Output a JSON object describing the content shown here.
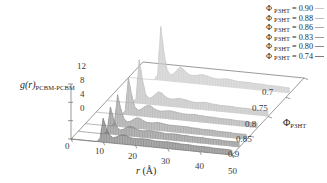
{
  "chart_data": {
    "type": "line",
    "title": "",
    "projection": "3d-waterfall",
    "xlabel": "r (Å)",
    "ylabel": "g(r)PCBM-PCBM",
    "zlabel": "ΦP3HT",
    "xlim": [
      0,
      50
    ],
    "ylim": [
      0,
      12
    ],
    "zlim": [
      0.7,
      0.9
    ],
    "grid": false,
    "legend_position": "top-right",
    "x_ticks": [
      "0",
      "10",
      "20",
      "30",
      "40",
      "50"
    ],
    "y_ticks": [
      "0",
      "4",
      "8",
      "12"
    ],
    "z_ticks": [
      "0.7",
      "0.75",
      "0.8",
      "0.85",
      "0.9"
    ],
    "x_tick_values": [
      0,
      10,
      20,
      30,
      40,
      50
    ],
    "y_tick_values": [
      0,
      4,
      8,
      12
    ],
    "z_tick_values": [
      0.7,
      0.75,
      0.8,
      0.85,
      0.9
    ],
    "x": [
      0,
      1,
      2,
      3,
      4,
      5,
      6,
      7,
      8,
      9,
      10,
      11,
      12,
      13,
      14,
      15,
      16,
      17,
      18,
      19,
      20,
      21,
      22,
      23,
      24,
      25,
      26,
      27,
      28,
      29,
      30,
      31,
      32,
      33,
      34,
      35,
      36,
      37,
      38,
      39,
      40,
      41,
      42,
      43,
      44,
      45,
      46,
      47,
      48,
      49,
      50
    ],
    "series": [
      {
        "name": "ΦP3HT = 0.74",
        "z": 0.74,
        "color": "#c9c9c9",
        "values": [
          0,
          0,
          0,
          0,
          0,
          0,
          0,
          0,
          0.05,
          1.2,
          11.8,
          6.2,
          2.4,
          1.5,
          1.8,
          2.6,
          3.4,
          3.0,
          2.3,
          1.9,
          1.8,
          1.9,
          2.1,
          2.2,
          2.1,
          1.9,
          1.7,
          1.6,
          1.6,
          1.7,
          1.8,
          1.8,
          1.7,
          1.6,
          1.5,
          1.5,
          1.5,
          1.5,
          1.5,
          1.4,
          1.4,
          1.4,
          1.4,
          1.3,
          1.3,
          1.3,
          1.3,
          1.3,
          1.2,
          1.2,
          1.2
        ]
      },
      {
        "name": "ΦP3HT = 0.80",
        "z": 0.8,
        "color": "#bdbdbd",
        "values": [
          0,
          0,
          0,
          0,
          0,
          0,
          0,
          0,
          0.05,
          1.0,
          9.6,
          5.4,
          2.2,
          1.4,
          1.7,
          2.4,
          3.0,
          2.8,
          2.2,
          1.8,
          1.7,
          1.8,
          2.0,
          2.0,
          1.9,
          1.8,
          1.6,
          1.5,
          1.5,
          1.6,
          1.7,
          1.7,
          1.6,
          1.5,
          1.5,
          1.4,
          1.4,
          1.4,
          1.4,
          1.4,
          1.3,
          1.3,
          1.3,
          1.3,
          1.3,
          1.2,
          1.2,
          1.2,
          1.2,
          1.2,
          1.1
        ]
      },
      {
        "name": "ΦP3HT = 0.83",
        "z": 0.83,
        "color": "#ababab",
        "values": [
          0,
          0,
          0,
          0,
          0,
          0,
          0,
          0,
          0.05,
          0.9,
          8.2,
          4.6,
          2.0,
          1.3,
          1.6,
          2.2,
          2.6,
          2.5,
          2.0,
          1.7,
          1.6,
          1.7,
          1.8,
          1.9,
          1.8,
          1.7,
          1.6,
          1.5,
          1.5,
          1.5,
          1.6,
          1.6,
          1.5,
          1.5,
          1.4,
          1.4,
          1.4,
          1.4,
          1.3,
          1.3,
          1.3,
          1.3,
          1.3,
          1.2,
          1.2,
          1.2,
          1.2,
          1.2,
          1.1,
          1.1,
          1.1
        ]
      },
      {
        "name": "ΦP3HT = 0.86",
        "z": 0.86,
        "color": "#9a9a9a",
        "values": [
          0,
          0,
          0,
          0,
          0,
          0,
          0,
          0,
          0.05,
          0.8,
          7.0,
          4.0,
          1.9,
          1.3,
          1.5,
          2.0,
          2.4,
          2.3,
          1.9,
          1.6,
          1.6,
          1.6,
          1.8,
          1.8,
          1.7,
          1.6,
          1.5,
          1.5,
          1.5,
          1.5,
          1.5,
          1.5,
          1.5,
          1.4,
          1.4,
          1.4,
          1.3,
          1.3,
          1.3,
          1.3,
          1.3,
          1.2,
          1.2,
          1.2,
          1.2,
          1.2,
          1.1,
          1.1,
          1.1,
          1.1,
          1.1
        ]
      },
      {
        "name": "ΦP3HT = 0.88",
        "z": 0.88,
        "color": "#8a8a8a",
        "values": [
          0,
          0,
          0,
          0,
          0,
          0,
          0,
          0,
          0.05,
          0.7,
          6.0,
          3.5,
          1.8,
          1.2,
          1.4,
          1.9,
          2.2,
          2.1,
          1.8,
          1.6,
          1.5,
          1.6,
          1.7,
          1.7,
          1.6,
          1.6,
          1.5,
          1.4,
          1.4,
          1.5,
          1.5,
          1.5,
          1.4,
          1.4,
          1.4,
          1.3,
          1.3,
          1.3,
          1.3,
          1.3,
          1.2,
          1.2,
          1.2,
          1.2,
          1.2,
          1.1,
          1.1,
          1.1,
          1.1,
          1.1,
          1.1
        ]
      },
      {
        "name": "ΦP3HT = 0.90",
        "z": 0.9,
        "color": "#7a7a7a",
        "values": [
          0,
          0,
          0,
          0,
          0,
          0,
          0,
          0,
          0.05,
          0.7,
          5.2,
          3.1,
          1.7,
          1.2,
          1.4,
          1.8,
          2.0,
          2.0,
          1.7,
          1.5,
          1.5,
          1.5,
          1.6,
          1.6,
          1.6,
          1.5,
          1.4,
          1.4,
          1.4,
          1.4,
          1.5,
          1.4,
          1.4,
          1.4,
          1.3,
          1.3,
          1.3,
          1.3,
          1.2,
          1.2,
          1.2,
          1.2,
          1.2,
          1.2,
          1.1,
          1.1,
          1.1,
          1.1,
          1.1,
          1.1,
          1.0
        ]
      }
    ],
    "legend_entries": [
      {
        "label": "ΦP3HT = 0.90"
      },
      {
        "label": "ΦP3HT = 0.88"
      },
      {
        "label": "ΦP3HT = 0.86"
      },
      {
        "label": "ΦP3HT = 0.83"
      },
      {
        "label": "ΦP3HT = 0.80"
      },
      {
        "label": "ΦP3HT = 0.74"
      }
    ]
  },
  "legend": {
    "rows": [
      {
        "phi": "Φ",
        "sub": "P3HT",
        "eq": " = ",
        "value": "0.90"
      },
      {
        "phi": "Φ",
        "sub": "P3HT",
        "eq": " = ",
        "value": "0.88"
      },
      {
        "phi": "Φ",
        "sub": "P3HT",
        "eq": " = ",
        "value": "0.86"
      },
      {
        "phi": "Φ",
        "sub": "P3HT",
        "eq": " = ",
        "value": "0.83"
      },
      {
        "phi": "Φ",
        "sub": "P3HT",
        "eq": " = ",
        "value": "0.80"
      },
      {
        "phi": "Φ",
        "sub": "P3HT",
        "eq": " = ",
        "value": "0.74"
      }
    ]
  },
  "axes": {
    "y_label_main": "g(r)",
    "y_label_sub": "PCBM-PCBM",
    "y_label_g": "g",
    "y_label_r": "(r)",
    "x_label": "r (Å)",
    "x_label_italic": "r",
    "x_label_unit": " (Å)",
    "z_label_phi": "Φ",
    "z_label_sub": "P3HT",
    "y_ticks": [
      "12",
      "8",
      "4",
      "0"
    ],
    "x_ticks": [
      "0",
      "10",
      "20",
      "30",
      "40",
      "50"
    ],
    "z_ticks": [
      "0.7",
      "0.75",
      "0.8",
      "0.85",
      "0.9"
    ]
  }
}
